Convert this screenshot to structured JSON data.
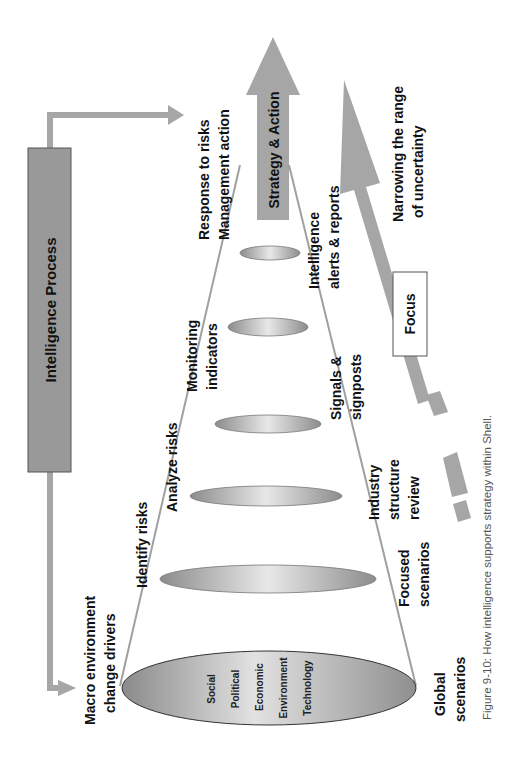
{
  "diagram": {
    "process_box": {
      "label": "Intelligence Process"
    },
    "strategy_arrow": {
      "label": "Strategy & Action"
    },
    "focus_box": {
      "label": "Focus"
    },
    "narrowing_label": {
      "line1": "Narrowing the range",
      "line2": "of uncertainty"
    },
    "upper_stages": [
      {
        "line1": "Macro environment",
        "line2": "change drivers"
      },
      {
        "line1": "Identify risks",
        "line2": ""
      },
      {
        "line1": "Analyze risks",
        "line2": ""
      },
      {
        "line1": "Monitoring",
        "line2": "indicators"
      },
      {
        "line1": "Response to risks",
        "line2": "Management action"
      }
    ],
    "lower_stages": [
      {
        "line1": "Global",
        "line2": "scenarios",
        "line3": ""
      },
      {
        "line1": "Focused",
        "line2": "scenarios",
        "line3": ""
      },
      {
        "line1": "Industry",
        "line2": "structure",
        "line3": "review"
      },
      {
        "line1": "Signals &",
        "line2": "signposts",
        "line3": ""
      },
      {
        "line1": "Intelligence",
        "line2": "alerts & reports",
        "line3": ""
      }
    ],
    "drivers": [
      "Social",
      "Political",
      "Economic",
      "Environment",
      "Technology"
    ]
  },
  "caption": "Figure 9-10:  How intelligence supports strategy within Shell.",
  "colors": {
    "arrow_gray": "#a6a6a6",
    "box_gray": "#999999",
    "cone_line": "#a0a0a0",
    "ellipse_dark": "#8c8c8c",
    "ellipse_light": "#e6e6e6"
  }
}
